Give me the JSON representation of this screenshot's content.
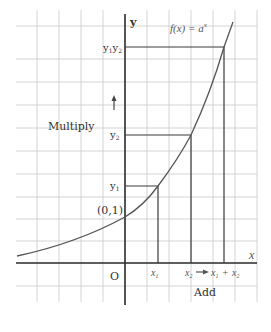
{
  "diagram": {
    "function_label": "f(x) = a",
    "function_exponent": "x",
    "axes": {
      "x_label": "x",
      "y_label": "y",
      "origin_label": "O"
    },
    "intercept_label": "(0,1)",
    "y_marks": {
      "y1": "y",
      "y1_sub": "1",
      "y2": "y",
      "y2_sub": "2",
      "y1y2_a": "y",
      "y1y2_a_sub": "1",
      "y1y2_b": "y",
      "y1y2_b_sub": "2"
    },
    "x_marks": {
      "x1": "x",
      "x1_sub": "1",
      "x2": "x",
      "x2_sub": "2",
      "sum_a": "x",
      "sum_a_sub": "1",
      "plus": "+",
      "sum_b": "x",
      "sum_b_sub": "2"
    },
    "annotations": {
      "multiply": "Multiply",
      "add": "Add"
    },
    "colors": {
      "grid": "#c9c9c9",
      "axis": "#2a2a2a",
      "curve": "#555555"
    }
  }
}
